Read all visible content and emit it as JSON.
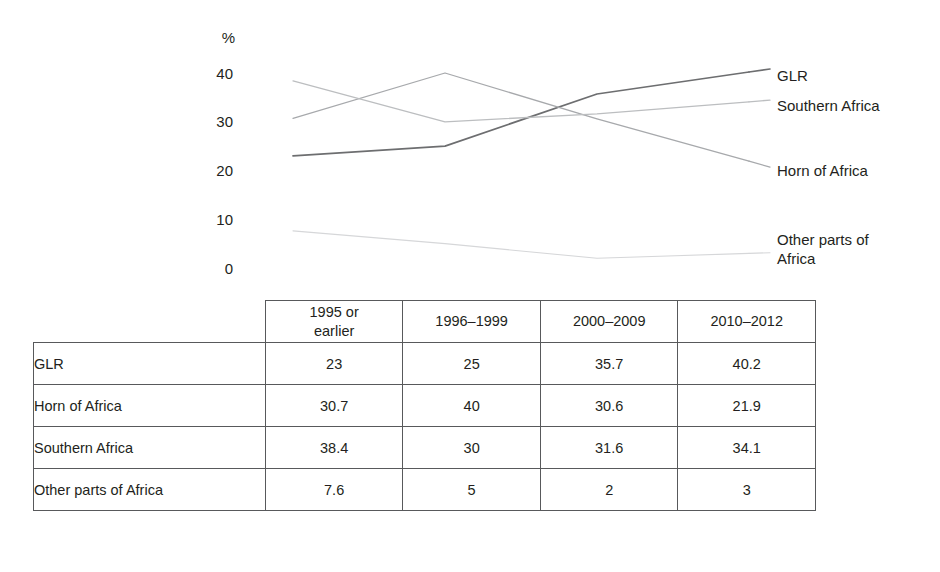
{
  "chart_data": {
    "type": "line",
    "title": "",
    "xlabel": "",
    "ylabel": "%",
    "ylim": [
      0,
      40
    ],
    "yticks": [
      0,
      10,
      20,
      30,
      40
    ],
    "ytick_labels": [
      "0",
      "10",
      "20",
      "30",
      "40"
    ],
    "grid": false,
    "legend_position": "right-inline-labels",
    "categories": [
      "1995 or earlier",
      "1996–1999",
      "2000–2009",
      "2010–2012"
    ],
    "series": [
      {
        "name": "GLR",
        "values": [
          23,
          25,
          35.7,
          40.2
        ],
        "color": "#6d6e70"
      },
      {
        "name": "Horn of Africa",
        "values": [
          30.7,
          40,
          30.6,
          21.9
        ],
        "color": "#a7a9ac"
      },
      {
        "name": "Southern Africa",
        "values": [
          38.4,
          30,
          31.6,
          34.1
        ],
        "color": "#bcbec0"
      },
      {
        "name": "Other parts of Africa",
        "values": [
          7.6,
          5,
          2,
          3
        ],
        "color": "#d6d7d9"
      }
    ]
  },
  "axis": {
    "unit_label": "%",
    "ticks": [
      "40",
      "30",
      "20",
      "10",
      "0"
    ]
  },
  "series_labels": [
    {
      "text": "GLR"
    },
    {
      "text": "Southern Africa"
    },
    {
      "text": "Horn of Africa"
    },
    {
      "text": "Other parts of\nAfrica"
    }
  ],
  "table": {
    "corner_label": "",
    "headers": [
      "1995 or\nearlier",
      "1996–1999",
      "2000–2009",
      "2010–2012"
    ],
    "rows": [
      {
        "label": "GLR",
        "values": [
          "23",
          "25",
          "35.7",
          "40.2"
        ]
      },
      {
        "label": "Horn of Africa",
        "values": [
          "30.7",
          "40",
          "30.6",
          "21.9"
        ]
      },
      {
        "label": "Southern Africa",
        "values": [
          "38.4",
          "30",
          "31.6",
          "34.1"
        ]
      },
      {
        "label": "Other parts of Africa",
        "values": [
          "7.6",
          "5",
          "2",
          "3"
        ]
      }
    ]
  }
}
